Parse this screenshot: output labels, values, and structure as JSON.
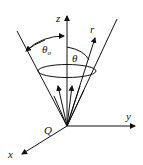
{
  "diagram": {
    "labels": {
      "z_axis": "z",
      "y_axis": "y",
      "x_axis": "x",
      "origin": "Q",
      "radial": "r",
      "cone_half_angle": "θ",
      "cone_half_angle_sub": "o",
      "polar_angle": "θ"
    },
    "colors": {
      "stroke": "#111111",
      "background": "#ffffff"
    }
  }
}
